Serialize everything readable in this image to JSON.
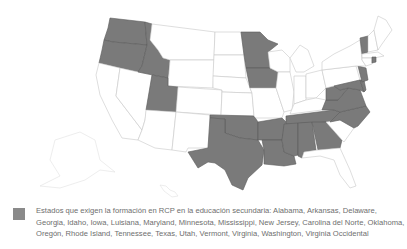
{
  "map": {
    "colors": {
      "required": "#7a7a7a",
      "not_required": "#ffffff",
      "border": "#c8c8c8",
      "legend_swatch": "#8a8a8a"
    },
    "states_required": [
      "Washington",
      "Oregon",
      "Idaho",
      "Utah",
      "Minnesota",
      "Iowa",
      "Oklahoma",
      "Texas",
      "Arkansas",
      "Louisiana",
      "Mississippi",
      "Alabama",
      "Georgia",
      "Tennessee",
      "North Carolina",
      "Virginia",
      "West Virginia",
      "Maryland",
      "Delaware",
      "New Jersey",
      "Rhode Island",
      "Vermont"
    ]
  },
  "legend": {
    "text": "Estados que exigen la formación en RCP en la educación secundaria: Alabama, Arkansas, Delaware, Georgia, Idaho, Iowa, Luisiana, Maryland, Minnesota, Mississippi, New Jersey, Carolina del Norte, Oklahoma, Oregón, Rhode Island, Tennessee, Texas, Utah, Vermont, Virginia, Washington, Virginia Occidental"
  }
}
